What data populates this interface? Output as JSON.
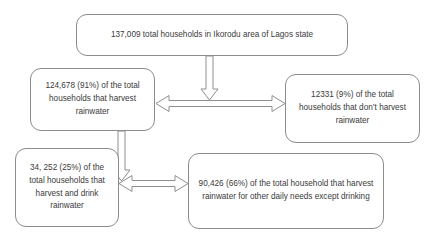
{
  "diagram": {
    "background_color": "#ffffff",
    "box_border_color": "#8c8c8c",
    "arrow_stroke_color": "#8f8f8f",
    "text_color": "#3a3a3a",
    "nodes": {
      "total": {
        "id": "total-households",
        "text": "137,009 total households in Ikorodu area of Lagos state",
        "value": "137,009",
        "percent": ""
      },
      "harvest": {
        "id": "harvest-rainwater",
        "text": "124,678 (91%) of the total households that harvest rainwater",
        "value": "124,678",
        "percent": "91%"
      },
      "no_harvest": {
        "id": "no-harvest-rainwater",
        "text": "12331 (9%) of the total households that don’t harvest rainwater",
        "value": "12331",
        "percent": "9%"
      },
      "drink": {
        "id": "harvest-and-drink",
        "text": "34, 252 (25%) of the total households that harvest and drink rainwater",
        "value": "34, 252",
        "percent": "25%"
      },
      "other_needs": {
        "id": "other-daily-needs",
        "text": "90,426 (66%) of the total household that harvest rainwater for other daily needs except drinking",
        "value": "90,426",
        "percent": "66%"
      }
    },
    "connectors": [
      {
        "name": "total-to-split-arrow",
        "style": "hollow-block-arrow",
        "direction": "down",
        "from": "total",
        "to": "harvest-no-harvest-divider"
      },
      {
        "name": "harvest-vs-no-harvest-arrow",
        "style": "hollow-block-arrow",
        "direction": "double-horizontal",
        "from": "harvest",
        "to": "no_harvest"
      },
      {
        "name": "harvest-to-usage-arrow",
        "style": "hollow-block-arrow",
        "direction": "down",
        "from": "harvest",
        "to": "drink-other-divider"
      },
      {
        "name": "drink-vs-other-needs-arrow",
        "style": "hollow-block-arrow",
        "direction": "double-horizontal",
        "from": "drink",
        "to": "other_needs"
      }
    ]
  }
}
